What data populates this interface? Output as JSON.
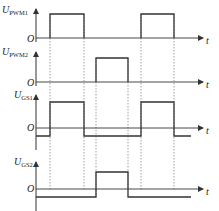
{
  "diagram": {
    "type": "timing-waveform",
    "time_axis_label": "t",
    "origin_label": "O",
    "line_color": "#333333",
    "dash_color": "#888888",
    "dashed_markers_x": [
      50,
      84,
      96,
      128,
      141,
      174
    ],
    "signals": [
      {
        "name": "U_PWM1",
        "label_main": "U",
        "label_sub": "PWM1",
        "baseline_y": 38,
        "axis_top_y": 4,
        "high_y": 14,
        "low_y": 38,
        "pulses": [
          [
            50,
            84
          ],
          [
            141,
            174
          ]
        ]
      },
      {
        "name": "U_PWM2",
        "label_main": "U",
        "label_sub": "PWM2",
        "baseline_y": 82,
        "axis_top_y": 47,
        "high_y": 58,
        "low_y": 82,
        "pulses": [
          [
            96,
            128
          ]
        ]
      },
      {
        "name": "U_GS1",
        "label_main": "U",
        "label_sub": "GS1",
        "baseline_y": 128,
        "axis_top_y": 90,
        "high_y": 102,
        "low_y": 136,
        "pulses": [
          [
            50,
            84
          ],
          [
            141,
            174
          ]
        ]
      },
      {
        "name": "U_GS2",
        "label_main": "U",
        "label_sub": "GS2",
        "baseline_y": 189,
        "axis_top_y": 157,
        "high_y": 172,
        "low_y": 197,
        "pulses": [
          [
            96,
            128
          ]
        ]
      }
    ]
  }
}
